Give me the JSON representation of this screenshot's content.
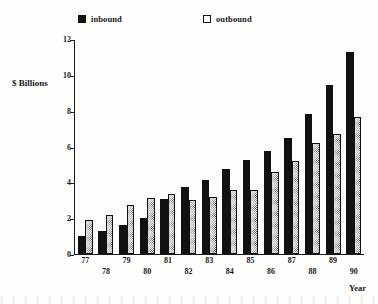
{
  "chart_data": {
    "type": "bar",
    "title": "",
    "xlabel": "Year",
    "ylabel": "$  Billions",
    "ylim": [
      0,
      12
    ],
    "yticks": [
      0,
      2,
      4,
      6,
      8,
      10,
      12
    ],
    "ytick_labels": [
      "0",
      "2",
      "4",
      "6",
      "8",
      "10",
      "12"
    ],
    "grid": false,
    "legend_position": "top",
    "categories": [
      "77",
      "78",
      "79",
      "80",
      "81",
      "82",
      "83",
      "84",
      "85",
      "86",
      "87",
      "88",
      "89",
      "90"
    ],
    "series": [
      {
        "name": "inbound",
        "pattern": "solid-black",
        "color": "#111111",
        "values": [
          1.0,
          1.3,
          1.65,
          2.0,
          3.1,
          3.75,
          4.15,
          4.75,
          5.25,
          5.8,
          6.5,
          7.85,
          9.45,
          11.3
        ]
      },
      {
        "name": "outbound",
        "pattern": "stipple-dotted",
        "color": "#f2f2f2",
        "values": [
          1.9,
          2.2,
          2.75,
          3.15,
          3.35,
          3.05,
          3.2,
          3.6,
          3.6,
          4.6,
          5.2,
          6.25,
          6.75,
          7.7
        ]
      }
    ]
  },
  "legend": {
    "inbound_label": "inbound",
    "outbound_label": "outbound"
  },
  "axes": {
    "y_title": "$  Billions",
    "x_title": "Year"
  }
}
